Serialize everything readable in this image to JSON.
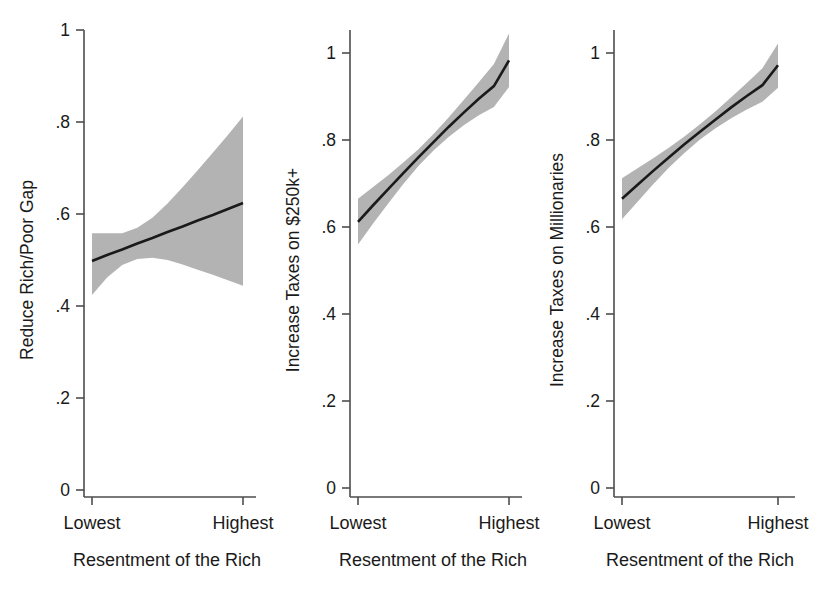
{
  "figure": {
    "background_color": "#ffffff",
    "panel_count": 3,
    "shared_x_axis_title": "Resentment of the Rich",
    "shared_x_tick_labels": [
      "Lowest",
      "Highest"
    ],
    "shared_y_tick_labels": [
      "0",
      ".2",
      ".4",
      ".6",
      ".8",
      "1"
    ],
    "line_color": "#1a1a1a",
    "band_color": "#b3b3b3",
    "axis_color": "#4d4d4d"
  },
  "panels": [
    {
      "id": "reduce-rich-poor-gap",
      "ylabel": "Reduce Rich/Poor Gap",
      "xlabel": "Resentment of the Rich",
      "xticks": [
        "Lowest",
        "Highest"
      ],
      "yticks": [
        "0",
        ".2",
        ".4",
        ".6",
        ".8",
        "1"
      ]
    },
    {
      "id": "increase-taxes-250k",
      "ylabel": "Increase Taxes on $250k+",
      "xlabel": "Resentment of the Rich",
      "xticks": [
        "Lowest",
        "Highest"
      ],
      "yticks": [
        "0",
        ".2",
        ".4",
        ".6",
        ".8",
        "1"
      ]
    },
    {
      "id": "increase-taxes-millionaries",
      "ylabel": "Increase Taxes on Millionaries",
      "xlabel": "Resentment of the Rich",
      "xticks": [
        "Lowest",
        "Highest"
      ],
      "yticks": [
        "0",
        ".2",
        ".4",
        ".6",
        ".8",
        "1"
      ]
    }
  ],
  "chart_data": [
    {
      "type": "line",
      "title": "",
      "xlabel": "Resentment of the Rich",
      "ylabel": "Reduce Rich/Poor Gap",
      "xlim": [
        0,
        1
      ],
      "ylim": [
        0,
        1
      ],
      "xtick_labels": [
        "Lowest",
        "Highest"
      ],
      "ytick_values": [
        0,
        0.2,
        0.4,
        0.6,
        0.8,
        1
      ],
      "ytick_labels": [
        "0",
        ".2",
        ".4",
        ".6",
        ".8",
        "1"
      ],
      "grid": false,
      "legend": "none",
      "x": [
        0,
        0.1,
        0.2,
        0.3,
        0.4,
        0.5,
        0.6,
        0.7,
        0.8,
        0.9,
        1
      ],
      "series": [
        {
          "name": "Predicted probability",
          "values": [
            0.498,
            0.511,
            0.523,
            0.536,
            0.548,
            0.561,
            0.573,
            0.586,
            0.598,
            0.611,
            0.624
          ]
        },
        {
          "name": "95% CI upper",
          "values": [
            0.558,
            0.558,
            0.558,
            0.57,
            0.592,
            0.623,
            0.658,
            0.695,
            0.733,
            0.772,
            0.812
          ]
        },
        {
          "name": "95% CI lower",
          "values": [
            0.424,
            0.462,
            0.489,
            0.502,
            0.505,
            0.5,
            0.49,
            0.479,
            0.468,
            0.456,
            0.444
          ]
        }
      ],
      "annotations": []
    },
    {
      "type": "line",
      "title": "",
      "xlabel": "Resentment of the Rich",
      "ylabel": "Increase Taxes on $250k+",
      "xlim": [
        0,
        1
      ],
      "ylim": [
        0,
        1
      ],
      "xtick_labels": [
        "Lowest",
        "Highest"
      ],
      "ytick_values": [
        0,
        0.2,
        0.4,
        0.6,
        0.8,
        1
      ],
      "ytick_labels": [
        "0",
        ".2",
        ".4",
        ".6",
        ".8",
        "1"
      ],
      "grid": false,
      "legend": "none",
      "x": [
        0,
        0.1,
        0.2,
        0.3,
        0.4,
        0.5,
        0.6,
        0.7,
        0.8,
        0.9,
        1
      ],
      "series": [
        {
          "name": "Predicted probability",
          "values": [
            0.612,
            0.65,
            0.687,
            0.724,
            0.76,
            0.795,
            0.83,
            0.863,
            0.895,
            0.924,
            0.983
          ]
        },
        {
          "name": "95% CI upper",
          "values": [
            0.665,
            0.692,
            0.719,
            0.748,
            0.779,
            0.814,
            0.852,
            0.892,
            0.933,
            0.975,
            1.045
          ]
        },
        {
          "name": "95% CI lower",
          "values": [
            0.56,
            0.608,
            0.654,
            0.699,
            0.74,
            0.776,
            0.807,
            0.834,
            0.857,
            0.876,
            0.922
          ]
        }
      ],
      "annotations": []
    },
    {
      "type": "line",
      "title": "",
      "xlabel": "Resentment of the Rich",
      "ylabel": "Increase Taxes on Millionaries",
      "xlim": [
        0,
        1
      ],
      "ylim": [
        0,
        1
      ],
      "xtick_labels": [
        "Lowest",
        "Highest"
      ],
      "ytick_values": [
        0,
        0.2,
        0.4,
        0.6,
        0.8,
        1
      ],
      "ytick_labels": [
        "0",
        ".2",
        ".4",
        ".6",
        ".8",
        "1"
      ],
      "grid": false,
      "legend": "none",
      "x": [
        0,
        0.1,
        0.2,
        0.3,
        0.4,
        0.5,
        0.6,
        0.7,
        0.8,
        0.9,
        1
      ],
      "series": [
        {
          "name": "Predicted probability",
          "values": [
            0.665,
            0.697,
            0.729,
            0.76,
            0.79,
            0.819,
            0.847,
            0.875,
            0.901,
            0.926,
            0.972
          ]
        },
        {
          "name": "95% CI upper",
          "values": [
            0.712,
            0.735,
            0.758,
            0.782,
            0.808,
            0.836,
            0.866,
            0.898,
            0.931,
            0.965,
            1.022
          ]
        },
        {
          "name": "95% CI lower",
          "values": [
            0.618,
            0.658,
            0.698,
            0.736,
            0.77,
            0.801,
            0.827,
            0.85,
            0.87,
            0.888,
            0.92
          ]
        }
      ],
      "annotations": []
    }
  ]
}
